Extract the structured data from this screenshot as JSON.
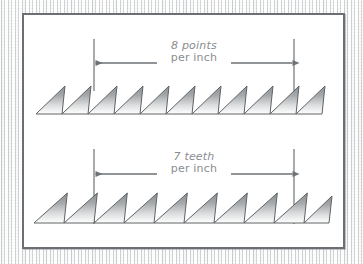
{
  "figure": {
    "name": "saw-tooth-count-diagram",
    "background_texture": "wood-grain",
    "panel_background": "#ffffff",
    "panel_border_color": "#6b6f73",
    "line_color": "#6e7275",
    "tooth_stroke_color": "#5f6366",
    "tooth_fill_top": "#8d9093",
    "tooth_fill_bottom": "#ffffff",
    "label_color": "#8a8d90"
  },
  "rows": [
    {
      "id": "points-row",
      "label_line1": "8 points",
      "label_line2": "per inch",
      "count": 8,
      "unit": "points",
      "per": "inch",
      "teeth_drawn": 10,
      "pitch_px": 29.0,
      "baseline_y": 112,
      "apex_y": 84,
      "measure_left_x": 92,
      "measure_right_x": 292,
      "dim_line_y": 62,
      "ext_line_top_y": 38,
      "ext_line_bottom_y": 88
    },
    {
      "id": "teeth-row",
      "label_line1": "7 teeth",
      "label_line2": "per inch",
      "count": 7,
      "unit": "teeth",
      "per": "inch",
      "teeth_drawn": 9,
      "pitch_px": 33.3,
      "baseline_y": 221,
      "apex_y": 191,
      "measure_left_x": 92,
      "measure_right_x": 292,
      "dim_line_y": 173,
      "ext_line_top_y": 148,
      "ext_line_bottom_y": 222
    }
  ],
  "annotations": {
    "arrow_head_label": "arrow-head",
    "dimension_label": "dimension-line",
    "extension_label": "extension-line"
  }
}
